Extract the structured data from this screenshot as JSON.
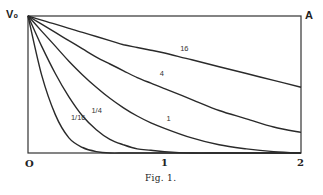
{
  "chart_data": {
    "type": "line",
    "title": "",
    "caption": "Fig. 1.",
    "xlabel": "",
    "ylabel": "",
    "y_axis_top_label": "V₀",
    "corner_label": "A",
    "xlim": [
      0,
      2
    ],
    "ylim": [
      0,
      1
    ],
    "x_ticks": [
      "0",
      "1",
      "2"
    ],
    "grid": false,
    "legend": "inline curve labels",
    "x": [
      0,
      0.1,
      0.2,
      0.3,
      0.4,
      0.5,
      0.6,
      0.7,
      0.8,
      0.9,
      1.0,
      1.2,
      1.4,
      1.6,
      1.8,
      2.0
    ],
    "series": [
      {
        "name": "16",
        "label": "16",
        "values": [
          1.0,
          0.97,
          0.94,
          0.91,
          0.88,
          0.85,
          0.82,
          0.79,
          0.77,
          0.75,
          0.73,
          0.68,
          0.63,
          0.58,
          0.53,
          0.48
        ]
      },
      {
        "name": "4",
        "label": "4",
        "values": [
          1.0,
          0.94,
          0.88,
          0.82,
          0.76,
          0.7,
          0.65,
          0.6,
          0.55,
          0.51,
          0.47,
          0.39,
          0.31,
          0.25,
          0.19,
          0.15
        ]
      },
      {
        "name": "1",
        "label": "1",
        "values": [
          1.0,
          0.89,
          0.78,
          0.67,
          0.57,
          0.48,
          0.4,
          0.33,
          0.27,
          0.22,
          0.18,
          0.11,
          0.06,
          0.03,
          0.01,
          0.0
        ]
      },
      {
        "name": "1/4",
        "label": "1/4",
        "values": [
          1.0,
          0.78,
          0.58,
          0.41,
          0.27,
          0.17,
          0.1,
          0.06,
          0.03,
          0.02,
          0.01,
          0.0,
          0.0,
          0.0,
          0.0,
          0.0
        ]
      },
      {
        "name": "1/16",
        "label": "1/16",
        "values": [
          1.0,
          0.57,
          0.28,
          0.11,
          0.04,
          0.01,
          0.0,
          0.0,
          0.0,
          0.0,
          0.0,
          0.0,
          0.0,
          0.0,
          0.0,
          0.0
        ]
      }
    ],
    "label_positions": [
      {
        "series": "16",
        "x": 1.1,
        "y": 0.73
      },
      {
        "series": "4",
        "x": 0.95,
        "y": 0.55
      },
      {
        "series": "1",
        "x": 1.0,
        "y": 0.22
      },
      {
        "series": "1/4",
        "x": 0.45,
        "y": 0.28
      },
      {
        "series": "1/16",
        "x": 0.3,
        "y": 0.23
      }
    ]
  },
  "labels": {
    "v0": "V₀",
    "a": "A",
    "x0": "O",
    "x1": "1",
    "x2": "2",
    "caption": "Fig. 1."
  }
}
